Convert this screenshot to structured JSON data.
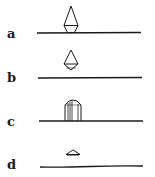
{
  "diagram": {
    "panels": [
      {
        "label": "a",
        "shape": "diamond-on-surface",
        "description": "Elongated diamond crystal touching the surface line with a trapezoidal base"
      },
      {
        "label": "b",
        "shape": "diamond-floating",
        "description": "Elongated diamond crystal detached above the surface line"
      },
      {
        "label": "c",
        "shape": "column-on-surface",
        "description": "Prism/column with pointed roof standing on the surface line"
      },
      {
        "label": "d",
        "shape": "flat-cap",
        "description": "Small flattened triangular cap above the surface line"
      }
    ],
    "colors": {
      "ink": "#1a1a1a",
      "background": "#ffffff"
    }
  }
}
